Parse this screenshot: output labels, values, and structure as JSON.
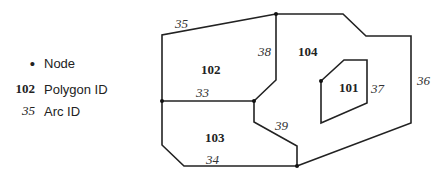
{
  "legend": {
    "items": [
      {
        "symbol": "•",
        "label": "Node"
      },
      {
        "symbol": "102",
        "label": "Polygon ID"
      },
      {
        "symbol": "35",
        "label": "Arc ID"
      }
    ]
  },
  "diagram": {
    "polygons": [
      {
        "id": "101"
      },
      {
        "id": "102"
      },
      {
        "id": "103"
      },
      {
        "id": "104"
      }
    ],
    "arcs": [
      {
        "id": "33"
      },
      {
        "id": "34"
      },
      {
        "id": "35"
      },
      {
        "id": "36"
      },
      {
        "id": "37"
      },
      {
        "id": "38"
      },
      {
        "id": "39"
      }
    ]
  }
}
